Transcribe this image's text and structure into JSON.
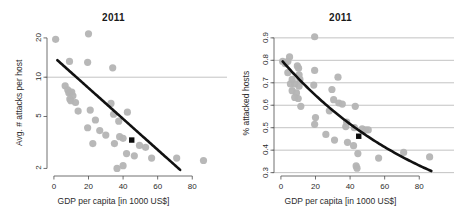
{
  "figure": {
    "panel_count": 2,
    "background_color": "#ffffff",
    "point_color": "#b4b4b4",
    "trend_color": "#111111",
    "highlight_color": "#0d0d0d",
    "gridline_color": "#9a9a9a"
  },
  "chart_data": [
    {
      "type": "scatter",
      "title": "2011",
      "xlabel": "GDP per capita [in 1000 US$]",
      "ylabel": "Avg. # attacks per host",
      "xlim": [
        -4,
        92
      ],
      "ylim": [
        1.75,
        23
      ],
      "yscale": "log",
      "xscale": "linear",
      "grid": "horizontal-single",
      "legend": "none",
      "xticks": [
        0,
        20,
        40,
        60,
        80
      ],
      "xtick_labels": [
        "0",
        "20",
        "40",
        "60",
        "80"
      ],
      "yticks": [
        2,
        5,
        10,
        20
      ],
      "ytick_labels": [
        "2",
        "5",
        "10",
        "20"
      ],
      "gridlines_y": [
        10
      ],
      "points": [
        {
          "x": 1.0,
          "y": 19.5
        },
        {
          "x": 20.0,
          "y": 21.5
        },
        {
          "x": 9.0,
          "y": 13.2
        },
        {
          "x": 19.5,
          "y": 13.0
        },
        {
          "x": 34.0,
          "y": 11.8
        },
        {
          "x": 6.5,
          "y": 8.6
        },
        {
          "x": 8.0,
          "y": 8.0
        },
        {
          "x": 8.6,
          "y": 7.6
        },
        {
          "x": 9.4,
          "y": 7.7
        },
        {
          "x": 10.3,
          "y": 7.7
        },
        {
          "x": 11.0,
          "y": 7.2
        },
        {
          "x": 9.2,
          "y": 6.8
        },
        {
          "x": 9.8,
          "y": 6.6
        },
        {
          "x": 12.5,
          "y": 6.4
        },
        {
          "x": 33.0,
          "y": 6.3
        },
        {
          "x": 14.0,
          "y": 5.5
        },
        {
          "x": 21.0,
          "y": 5.6
        },
        {
          "x": 34.5,
          "y": 5.2
        },
        {
          "x": 42.5,
          "y": 5.4
        },
        {
          "x": 24.0,
          "y": 4.7
        },
        {
          "x": 37.5,
          "y": 4.6
        },
        {
          "x": 19.5,
          "y": 4.1
        },
        {
          "x": 26.5,
          "y": 3.9
        },
        {
          "x": 30.0,
          "y": 3.6
        },
        {
          "x": 38.0,
          "y": 3.5
        },
        {
          "x": 40.0,
          "y": 3.4
        },
        {
          "x": 22.5,
          "y": 3.1
        },
        {
          "x": 35.0,
          "y": 3.1
        },
        {
          "x": 49.5,
          "y": 3.0
        },
        {
          "x": 53.0,
          "y": 2.9
        },
        {
          "x": 42.0,
          "y": 2.6
        },
        {
          "x": 46.5,
          "y": 2.5
        },
        {
          "x": 56.5,
          "y": 2.4
        },
        {
          "x": 71.0,
          "y": 2.4
        },
        {
          "x": 86.5,
          "y": 2.3
        },
        {
          "x": 40.0,
          "y": 2.1
        },
        {
          "x": 36.5,
          "y": 2.0
        }
      ],
      "highlight_point": {
        "x": 45.0,
        "y": 3.3,
        "marker": "square"
      },
      "trend": {
        "kind": "log-linear",
        "x_start": 2.0,
        "x_end": 73.0,
        "y_start": 13.5,
        "y_end": 1.95
      }
    },
    {
      "type": "scatter",
      "title": "2011",
      "xlabel": "GDP per capita [in 1000 US$]",
      "ylabel": "% attacked hosts",
      "xlim": [
        -4,
        92
      ],
      "ylim": [
        0.285,
        0.935
      ],
      "yscale": "linear",
      "xscale": "linear",
      "grid": "horizontal",
      "legend": "none",
      "xticks": [
        0,
        20,
        40,
        60,
        80
      ],
      "xtick_labels": [
        "0",
        "20",
        "40",
        "60",
        "80"
      ],
      "yticks": [
        0.3,
        0.4,
        0.5,
        0.6,
        0.7,
        0.8,
        0.9
      ],
      "ytick_labels": [
        "0.3",
        "0.4",
        "0.5",
        "0.6",
        "0.7",
        "0.8",
        "0.9"
      ],
      "gridlines_y": [
        0.3,
        0.4,
        0.5,
        0.6,
        0.7,
        0.8,
        0.9
      ],
      "points": [
        {
          "x": 19.5,
          "y": 0.905
        },
        {
          "x": 5.0,
          "y": 0.815
        },
        {
          "x": 1.0,
          "y": 0.795
        },
        {
          "x": 2.5,
          "y": 0.785
        },
        {
          "x": 4.0,
          "y": 0.795
        },
        {
          "x": 9.5,
          "y": 0.775
        },
        {
          "x": 10.2,
          "y": 0.765
        },
        {
          "x": 19.5,
          "y": 0.755
        },
        {
          "x": 4.0,
          "y": 0.745
        },
        {
          "x": 10.5,
          "y": 0.735
        },
        {
          "x": 6.5,
          "y": 0.715
        },
        {
          "x": 11.0,
          "y": 0.715
        },
        {
          "x": 33.0,
          "y": 0.725
        },
        {
          "x": 5.5,
          "y": 0.695
        },
        {
          "x": 8.0,
          "y": 0.695
        },
        {
          "x": 10.5,
          "y": 0.685
        },
        {
          "x": 19.0,
          "y": 0.69
        },
        {
          "x": 6.5,
          "y": 0.665
        },
        {
          "x": 9.0,
          "y": 0.655
        },
        {
          "x": 29.5,
          "y": 0.67
        },
        {
          "x": 8.0,
          "y": 0.635
        },
        {
          "x": 10.0,
          "y": 0.63
        },
        {
          "x": 30.5,
          "y": 0.625
        },
        {
          "x": 33.5,
          "y": 0.61
        },
        {
          "x": 35.5,
          "y": 0.605
        },
        {
          "x": 11.5,
          "y": 0.595
        },
        {
          "x": 43.0,
          "y": 0.595
        },
        {
          "x": 28.0,
          "y": 0.575
        },
        {
          "x": 20.0,
          "y": 0.545
        },
        {
          "x": 38.0,
          "y": 0.525
        },
        {
          "x": 19.5,
          "y": 0.515
        },
        {
          "x": 37.5,
          "y": 0.505
        },
        {
          "x": 42.5,
          "y": 0.5
        },
        {
          "x": 47.0,
          "y": 0.495
        },
        {
          "x": 49.0,
          "y": 0.49
        },
        {
          "x": 50.5,
          "y": 0.49
        },
        {
          "x": 26.0,
          "y": 0.47
        },
        {
          "x": 31.0,
          "y": 0.445
        },
        {
          "x": 38.5,
          "y": 0.435
        },
        {
          "x": 42.0,
          "y": 0.42
        },
        {
          "x": 44.5,
          "y": 0.385
        },
        {
          "x": 71.0,
          "y": 0.39
        },
        {
          "x": 56.5,
          "y": 0.365
        },
        {
          "x": 86.0,
          "y": 0.37
        },
        {
          "x": 43.5,
          "y": 0.33
        },
        {
          "x": 44.0,
          "y": 0.32
        }
      ],
      "highlight_point": {
        "x": 45.0,
        "y": 0.462,
        "marker": "square"
      },
      "trend": {
        "kind": "exponential-decay",
        "x_start": 1.0,
        "x_end": 87.0,
        "y_start": 0.795,
        "y_end": 0.307
      }
    }
  ]
}
